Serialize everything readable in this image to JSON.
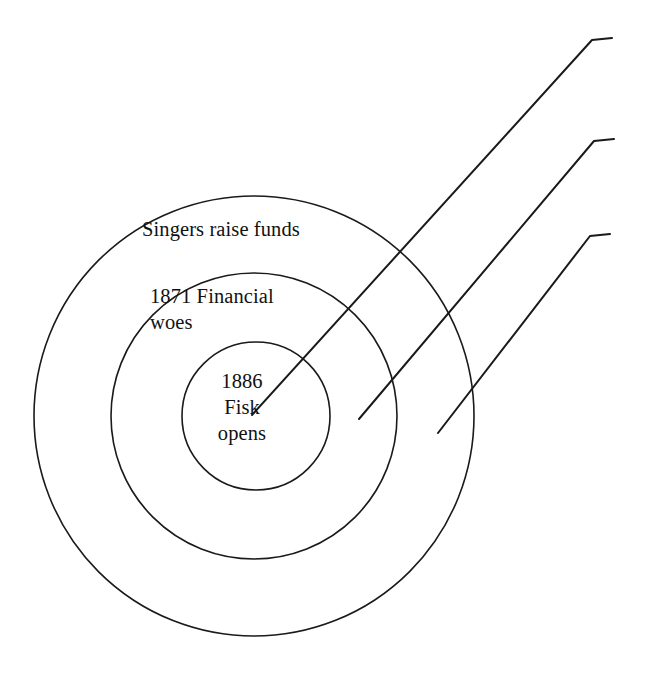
{
  "diagram": {
    "type": "concentric-circles",
    "background_color": "#ffffff",
    "stroke_color": "#1a1a1a",
    "text_color": "#111111",
    "canvas": {
      "width": 647,
      "height": 674
    },
    "center": {
      "x": 254,
      "y": 416
    },
    "rings": [
      {
        "id": "outer",
        "name": "singers-raise-funds-ring",
        "radius": 220,
        "label": "Singers raise funds",
        "label_position": {
          "x": 142,
          "y": 216
        }
      },
      {
        "id": "middle",
        "name": "financial-woes-ring",
        "radius": 143,
        "label": "1871 Financial\nwoes",
        "label_position": {
          "x": 150,
          "y": 283
        }
      },
      {
        "id": "inner",
        "name": "fisk-opens-ring",
        "radius": 74,
        "label": "1886\nFisk\nopens",
        "label_position": {
          "x": 196,
          "y": 368
        }
      }
    ],
    "leader_lines": [
      {
        "id": "leader-1",
        "name": "leader-line-inner",
        "start": {
          "x": 252,
          "y": 415
        },
        "elbow": {
          "x": 592,
          "y": 40
        },
        "end": {
          "x": 612,
          "y": 38
        }
      },
      {
        "id": "leader-2",
        "name": "leader-line-middle",
        "start": {
          "x": 359,
          "y": 419
        },
        "elbow": {
          "x": 594,
          "y": 141
        },
        "end": {
          "x": 614,
          "y": 139
        }
      },
      {
        "id": "leader-3",
        "name": "leader-line-outer",
        "start": {
          "x": 438,
          "y": 433
        },
        "elbow": {
          "x": 590,
          "y": 236
        },
        "end": {
          "x": 610,
          "y": 234
        }
      }
    ]
  }
}
